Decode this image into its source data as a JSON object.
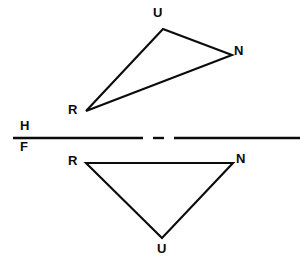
{
  "figure": {
    "background_color": "#ffffff",
    "line_color": "#0b0b0b",
    "width": 307,
    "height": 263,
    "partial_top_text": "",
    "labels": {
      "u_top": "U",
      "n_top": "N",
      "r_top": "R",
      "r_bottom": "R",
      "n_bottom": "N",
      "u_bottom": "U",
      "h_plane": "H",
      "f_plane": "F"
    },
    "reference_line": {
      "name": "HF folding line",
      "upper_label": "H",
      "lower_label": "F",
      "y": 138,
      "x_start": 13,
      "x_end": 300,
      "stroke_width": 2.4,
      "segments": [
        {
          "x1": 13,
          "x2": 143
        },
        {
          "x1": 153,
          "x2": 163
        },
        {
          "x1": 173,
          "x2": 300
        }
      ]
    },
    "top_view": {
      "name": "horizontal-projection-triangle",
      "stroke_width": 2.1,
      "points": [
        {
          "label": "U",
          "x": 163,
          "y": 29
        },
        {
          "label": "N",
          "x": 232,
          "y": 55
        },
        {
          "label": "R",
          "x": 86,
          "y": 111
        }
      ]
    },
    "front_view": {
      "name": "frontal-projection-triangle",
      "stroke_width": 2.1,
      "points": [
        {
          "label": "R",
          "x": 86,
          "y": 163
        },
        {
          "label": "N",
          "x": 233,
          "y": 163
        },
        {
          "label": "U",
          "x": 162,
          "y": 238
        }
      ]
    }
  }
}
